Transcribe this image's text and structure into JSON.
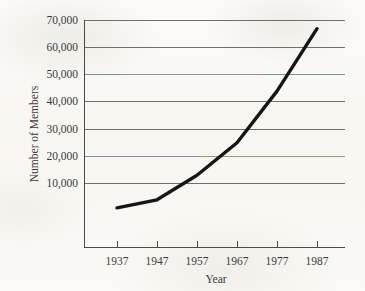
{
  "chart_data": {
    "type": "line",
    "title": "",
    "xlabel": "Year",
    "ylabel": "Number of Members",
    "categories": [
      "1937",
      "1947",
      "1957",
      "1967",
      "1977",
      "1987"
    ],
    "x": [
      1937,
      1947,
      1957,
      1967,
      1977,
      1987
    ],
    "values": [
      1000,
      4000,
      13000,
      25000,
      44000,
      67000
    ],
    "series": [
      {
        "name": "Number of Members",
        "values": [
          1000,
          4000,
          13000,
          25000,
          44000,
          67000
        ]
      }
    ],
    "xlim": [
      1932,
      1992
    ],
    "ylim": [
      -3600,
      70000
    ],
    "ytick_values": [
      10000,
      20000,
      30000,
      40000,
      50000,
      60000,
      70000
    ],
    "ytick_labels": [
      "10,000",
      "20,000",
      "30,000",
      "40,000",
      "50,000",
      "60,000",
      "70,000"
    ],
    "xtick_labels": [
      "1937",
      "1947",
      "1957",
      "1967",
      "1977",
      "1987"
    ],
    "grid": true,
    "grid_axis": "y",
    "legend": false,
    "legend_position": "none",
    "line_color": "#161616",
    "grid_color": "#6f6f6f",
    "axis_color": "#4a4a4a",
    "background_color": "#fbfaf7",
    "text_color": "#3a3a3a",
    "markers": false,
    "annotations": []
  },
  "axis": {
    "y_title": "Number of Members",
    "x_title": "Year",
    "y_labels": {
      "t70000": "70,000",
      "t60000": "60,000",
      "t50000": "50,000",
      "t40000": "40,000",
      "t30000": "30,000",
      "t20000": "20,000",
      "t10000": "10,000"
    },
    "x_labels": {
      "t1937": "1937",
      "t1947": "1947",
      "t1957": "1957",
      "t1967": "1967",
      "t1977": "1977",
      "t1987": "1987"
    }
  }
}
